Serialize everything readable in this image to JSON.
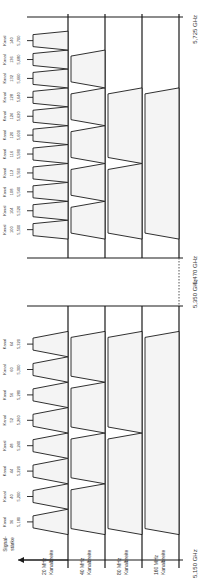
{
  "diagram": {
    "orientation": "rotated-90-ccw",
    "axis_label": "Signal-stärke",
    "frequency_marks": [
      {
        "label": "5,150 GHz",
        "mhz": 5150
      },
      {
        "label": "5,350 GHz",
        "mhz": 5350
      },
      {
        "label": "5,470 GHz",
        "mhz": 5470
      },
      {
        "label": "5,725 GHz",
        "mhz": 5725
      }
    ],
    "rows": [
      {
        "label_line1": "20 MHz",
        "label_line2": "Kanalbreite",
        "width_mhz": 20
      },
      {
        "label_line1": "40 MHz",
        "label_line2": "Kanalbreite",
        "width_mhz": 40
      },
      {
        "label_line1": "80 MHz",
        "label_line2": "Kanalbreite",
        "width_mhz": 80
      },
      {
        "label_line1": "160 MHz",
        "label_line2": "Kanalbreite",
        "width_mhz": 160
      }
    ],
    "channel_word": "Kanal",
    "channels_lower": [
      {
        "num": "36",
        "freq": "5,180"
      },
      {
        "num": "40",
        "freq": "5,200"
      },
      {
        "num": "44",
        "freq": "5,220"
      },
      {
        "num": "48",
        "freq": "5,240"
      },
      {
        "num": "52",
        "freq": "5,260"
      },
      {
        "num": "56",
        "freq": "5,280"
      },
      {
        "num": "60",
        "freq": "5,300"
      },
      {
        "num": "64",
        "freq": "5,320"
      }
    ],
    "channels_upper": [
      {
        "num": "100",
        "freq": "5,500"
      },
      {
        "num": "104",
        "freq": "5,520"
      },
      {
        "num": "108",
        "freq": "5,540"
      },
      {
        "num": "112",
        "freq": "5,560"
      },
      {
        "num": "116",
        "freq": "5,580"
      },
      {
        "num": "120",
        "freq": "5,600"
      },
      {
        "num": "124",
        "freq": "5,620"
      },
      {
        "num": "128",
        "freq": "5,640"
      },
      {
        "num": "132",
        "freq": "5,660"
      },
      {
        "num": "136",
        "freq": "5,680"
      },
      {
        "num": "140",
        "freq": "5,700"
      }
    ],
    "blocks": {
      "lower": {
        "w40": 4,
        "w80": 2,
        "w160": 1
      },
      "upper": {
        "w40": 5,
        "w80": 2,
        "w160": 1
      }
    },
    "colors": {
      "line": "#1a1a1a",
      "fill": "#f4f4f4",
      "text": "#333333",
      "gap": "#555555"
    }
  }
}
